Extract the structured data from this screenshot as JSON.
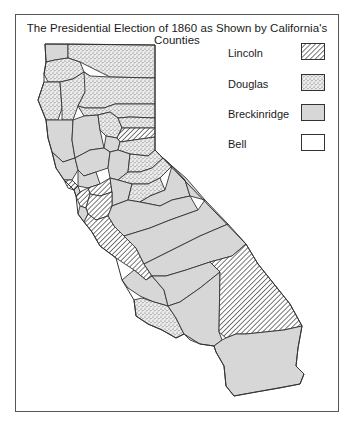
{
  "title": "The Presidential Election of 1860 as Shown by California's Counties",
  "legend": {
    "items": [
      {
        "label": "Lincoln",
        "pattern": "diagonal-hatch"
      },
      {
        "label": "Douglas",
        "pattern": "sparse-stipple"
      },
      {
        "label": "Breckinridge",
        "pattern": "dense-stipple"
      },
      {
        "label": "Bell",
        "pattern": "blank"
      }
    ]
  },
  "colors": {
    "outline": "#333333",
    "frame": "#555555",
    "douglas_fill": "#e4e4e4",
    "breckinridge_fill": "#d6d6d6",
    "lincoln_hatch": "#333333",
    "bell_fill": "#ffffff"
  }
}
